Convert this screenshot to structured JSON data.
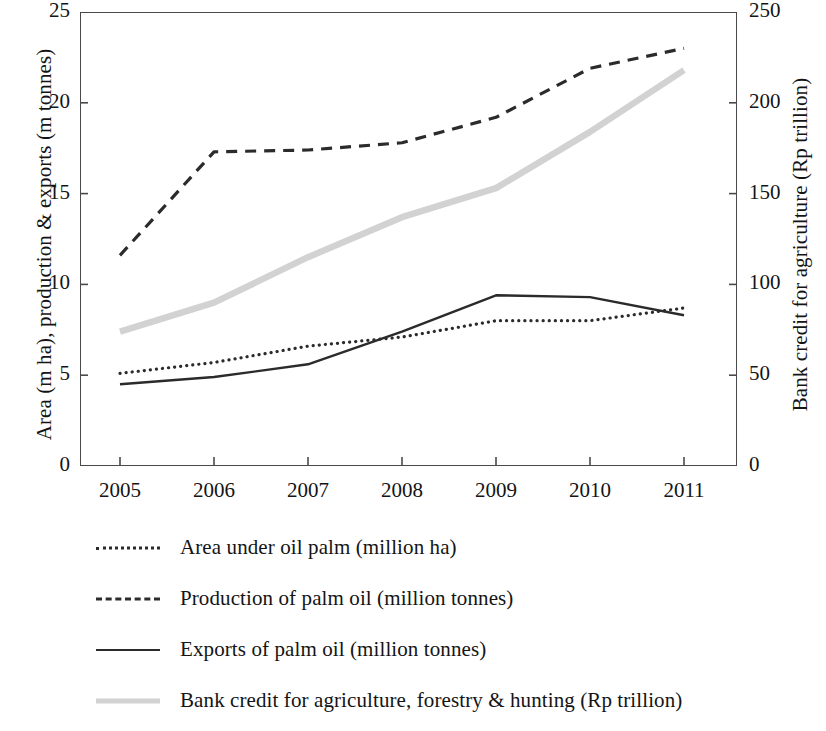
{
  "chart_data": {
    "type": "line",
    "title": "",
    "x": [
      2005,
      2006,
      2007,
      2008,
      2009,
      2010,
      2011
    ],
    "xtick_labels": [
      "2005",
      "2006",
      "2007",
      "2008",
      "2009",
      "2010",
      "2011"
    ],
    "xlabel": "",
    "grid": false,
    "legend_position": "below",
    "axes": {
      "left": {
        "label": "Area (m ha), production & exports (m tonnes)",
        "ticks": [
          0,
          5,
          10,
          15,
          20,
          25
        ],
        "tick_labels": [
          "0",
          "5",
          "10",
          "15",
          "20",
          "25"
        ],
        "lim": [
          0,
          25
        ]
      },
      "right": {
        "label": "Bank credit for agriculture (Rp trillion)",
        "ticks": [
          0,
          50,
          100,
          150,
          200,
          250
        ],
        "tick_labels": [
          "0",
          "50",
          "100",
          "150",
          "200",
          "250"
        ],
        "lim": [
          0,
          250
        ]
      }
    },
    "series": [
      {
        "name": "Area under oil palm (million ha)",
        "axis": "left",
        "style": "dotted",
        "color": "#2b2b2b",
        "values": [
          5.1,
          5.7,
          6.6,
          7.1,
          8.0,
          8.0,
          8.7
        ]
      },
      {
        "name": "Production of palm oil (million tonnes)",
        "axis": "left",
        "style": "dashed",
        "color": "#2b2b2b",
        "values": [
          11.6,
          17.3,
          17.4,
          17.8,
          19.2,
          21.9,
          23.0
        ]
      },
      {
        "name": "Exports of palm oil (million tonnes)",
        "axis": "left",
        "style": "solid",
        "color": "#2b2b2b",
        "values": [
          4.5,
          4.9,
          5.6,
          7.4,
          9.4,
          9.3,
          8.3
        ]
      },
      {
        "name": "Bank credit for agriculture, forestry & hunting (Rp trillion)",
        "axis": "right",
        "style": "thick-gray",
        "color": "#d2d2d2",
        "values": [
          74,
          90,
          115,
          137,
          153,
          184,
          218
        ]
      }
    ]
  },
  "legend": {
    "items": [
      {
        "label": "Area under oil palm (million ha)",
        "style": "dotted"
      },
      {
        "label": "Production of palm oil (million tonnes)",
        "style": "dashed"
      },
      {
        "label": "Exports of palm oil (million tonnes)",
        "style": "solid"
      },
      {
        "label": "Bank credit for agriculture, forestry & hunting (Rp trillion)",
        "style": "thick-gray"
      }
    ]
  }
}
